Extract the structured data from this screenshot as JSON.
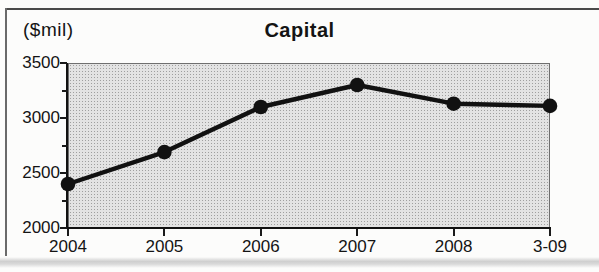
{
  "chart_data": {
    "type": "line",
    "title": "Capital",
    "unit_label": "($mil)",
    "categories": [
      "2004",
      "2005",
      "2006",
      "2007",
      "2008",
      "3-09"
    ],
    "series": [
      {
        "name": "Capital",
        "values": [
          2400,
          2690,
          3100,
          3300,
          3130,
          3110
        ]
      }
    ],
    "ylim": [
      2000,
      3500
    ],
    "yticks": [
      2000,
      2500,
      3000,
      3500
    ],
    "minor_yticks": [
      2250,
      2750,
      3250
    ],
    "grid": "off",
    "legend": "none",
    "line_color": "#111111",
    "marker": "filled-circle",
    "plot_background": "#d6d6d6"
  }
}
